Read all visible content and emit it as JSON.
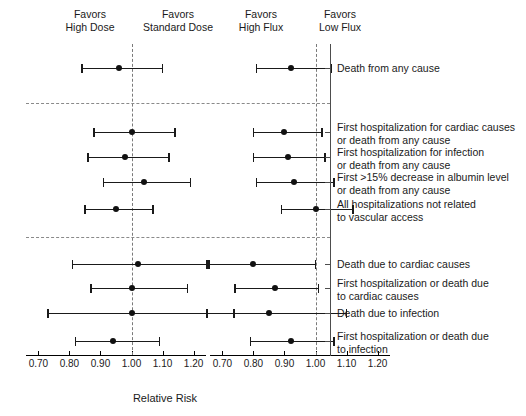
{
  "figure": {
    "xtitle": "Relative Risk",
    "headers": [
      {
        "line1": "Favors",
        "line2": "High Dose",
        "x": 90
      },
      {
        "line1": "Favors",
        "line2": "Standard Dose",
        "x": 178
      },
      {
        "line1": "Favors",
        "line2": "High Flux",
        "x": 261
      },
      {
        "line1": "Favors",
        "line2": "Low Flux",
        "x": 340
      }
    ]
  },
  "chart_data": {
    "type": "scatter",
    "title": "",
    "xlabel": "Relative Risk",
    "ylabel": "",
    "grid": false,
    "legend": "none",
    "reference_value": 1.0,
    "panels": [
      {
        "name": "dose",
        "favors_left": "High Dose",
        "favors_right": "Standard Dose",
        "xlim": [
          0.66,
          1.24
        ],
        "ticks": [
          0.7,
          0.8,
          0.9,
          1.0,
          1.1,
          1.2
        ],
        "tick_labels": [
          "0.70",
          "0.80",
          "0.90",
          "1.00",
          "1.10",
          "1.20"
        ]
      },
      {
        "name": "flux",
        "favors_left": "High Flux",
        "favors_right": "Low Flux",
        "xlim": [
          0.66,
          1.24
        ],
        "ticks": [
          0.7,
          0.8,
          0.9,
          1.0,
          1.1,
          1.2
        ],
        "tick_labels": [
          "0.70",
          "0.80",
          "0.90",
          "1.00",
          "1.10",
          "1.20"
        ]
      }
    ],
    "groups": [
      {
        "name": "primary",
        "outcomes": [
          {
            "label_lines": [
              "Death from any cause"
            ],
            "dose": {
              "estimate": 0.96,
              "low": 0.84,
              "high": 1.1
            },
            "flux": {
              "estimate": 0.92,
              "low": 0.81,
              "high": 1.05
            }
          }
        ]
      },
      {
        "name": "main-secondary",
        "outcomes": [
          {
            "label_lines": [
              "First hospitalization for cardiac causes",
              "or death from any cause"
            ],
            "dose": {
              "estimate": 1.0,
              "low": 0.88,
              "high": 1.14
            },
            "flux": {
              "estimate": 0.9,
              "low": 0.8,
              "high": 1.02
            }
          },
          {
            "label_lines": [
              "First hospitalization for infection",
              "or death from any cause"
            ],
            "dose": {
              "estimate": 0.98,
              "low": 0.86,
              "high": 1.12
            },
            "flux": {
              "estimate": 0.91,
              "low": 0.8,
              "high": 1.03
            }
          },
          {
            "label_lines": [
              "First >15% decrease in albumin level",
              "or death from any cause"
            ],
            "dose": {
              "estimate": 1.04,
              "low": 0.91,
              "high": 1.19
            },
            "flux": {
              "estimate": 0.93,
              "low": 0.81,
              "high": 1.06
            }
          },
          {
            "label_lines": [
              "All hospitalizations not related",
              "to vascular access"
            ],
            "dose": {
              "estimate": 0.95,
              "low": 0.85,
              "high": 1.07
            },
            "flux": {
              "estimate": 1.0,
              "low": 0.89,
              "high": 1.12
            }
          }
        ]
      },
      {
        "name": "other-secondary",
        "outcomes": [
          {
            "label_lines": [
              "Death due to cardiac causes"
            ],
            "dose": {
              "estimate": 1.02,
              "low": 0.81,
              "high": 1.25
            },
            "flux": {
              "estimate": 0.8,
              "low": 0.65,
              "high": 1.0
            }
          },
          {
            "label_lines": [
              "First hospitalization or death due",
              "to cardiac causes"
            ],
            "dose": {
              "estimate": 1.0,
              "low": 0.87,
              "high": 1.18
            },
            "flux": {
              "estimate": 0.87,
              "low": 0.74,
              "high": 1.01
            }
          },
          {
            "label_lines": [
              "Death due to infection"
            ],
            "dose": {
              "estimate": 1.0,
              "low": 0.73,
              "high": 1.33
            },
            "flux": {
              "estimate": 0.85,
              "low": 0.65,
              "high": 1.1
            }
          },
          {
            "label_lines": [
              "First hospitalization or death due",
              "to infection"
            ],
            "dose": {
              "estimate": 0.94,
              "low": 0.82,
              "high": 1.09
            },
            "flux": {
              "estimate": 0.92,
              "low": 0.79,
              "high": 1.06
            }
          }
        ]
      }
    ]
  }
}
